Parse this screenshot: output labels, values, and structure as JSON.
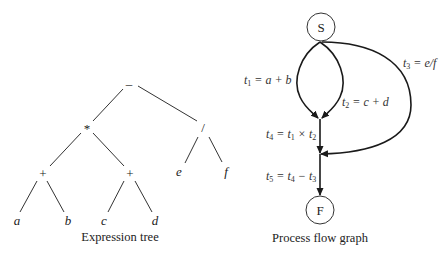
{
  "expression_tree": {
    "caption": "Expression tree",
    "nodes": {
      "root": "–",
      "mul": "*",
      "div": "/",
      "plus_left": "+",
      "plus_right": "+",
      "a": "a",
      "b": "b",
      "c": "c",
      "d": "d",
      "e": "e",
      "f": "f"
    }
  },
  "process_flow_graph": {
    "caption": "Process flow graph",
    "start_node": "S",
    "finish_node": "F",
    "edges": {
      "t1": {
        "var": "t",
        "sub": "1",
        "rhs": " = a + b"
      },
      "t2": {
        "var": "t",
        "sub": "2",
        "rhs": " = c + d"
      },
      "t3": {
        "var": "t",
        "sub": "3",
        "rhs": " = e/f"
      },
      "t4": {
        "var": "t",
        "sub": "4",
        "mid": " = t",
        "sub2": "1",
        "op": " × t",
        "sub3": "2"
      },
      "t5": {
        "var": "t",
        "sub": "5",
        "mid": " = t",
        "sub2": "4",
        "op": " − t",
        "sub3": "3"
      }
    }
  }
}
